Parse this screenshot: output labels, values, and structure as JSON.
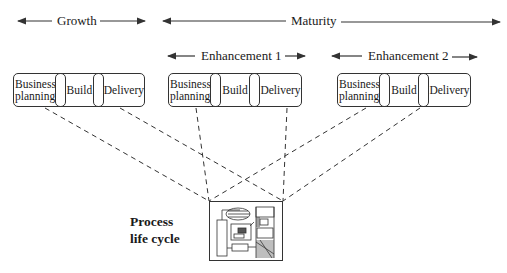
{
  "phases": {
    "growth": "Growth",
    "maturity": "Maturity",
    "enhancement_1": "Enhancement 1",
    "enhancement_2": "Enhancement 2"
  },
  "groups": [
    {
      "name": "growth",
      "stages": [
        "Business planning",
        "Build",
        "Delivery"
      ]
    },
    {
      "name": "enhancement-1",
      "stages": [
        "Business planning",
        "Build",
        "Delivery"
      ]
    },
    {
      "name": "enhancement-2",
      "stages": [
        "Business planning",
        "Build",
        "Delivery"
      ]
    }
  ],
  "stage_labels": {
    "business_line1": "Business",
    "business_line2": "planning",
    "build": "Build",
    "delivery": "Delivery"
  },
  "process": {
    "line1": "Process",
    "line2": "life cycle",
    "icon": "process-lifecycle-schematic-icon"
  },
  "colors": {
    "line": "#333333",
    "background": "#ffffff"
  }
}
